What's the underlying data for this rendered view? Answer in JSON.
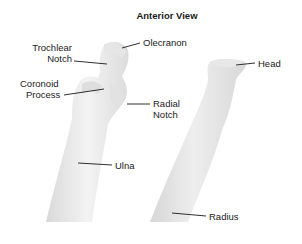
{
  "title": "Anterior View",
  "labels": {
    "olecranon": "Olecranon",
    "trochlear_notch_1": "Trochlear",
    "trochlear_notch_2": "Notch",
    "coronoid_process_1": "Coronoid",
    "coronoid_process_2": "Process",
    "radial_notch_1": "Radial",
    "radial_notch_2": "Notch",
    "ulna": "Ulna",
    "head": "Head",
    "radius": "Radius"
  },
  "colors": {
    "bone_light": "#f0f0f0",
    "bone_shadow": "#d2d2d2",
    "leader_line": "#1a1a1a",
    "text": "#1a1a1a"
  }
}
